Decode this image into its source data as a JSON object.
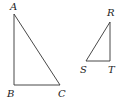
{
  "diagram": {
    "triangles": [
      {
        "name": "ABC",
        "right_angle_at": "B",
        "vertices": [
          {
            "label": "A",
            "x": 14,
            "y": 14,
            "lx": 13,
            "ly": 9
          },
          {
            "label": "B",
            "x": 14,
            "y": 85,
            "lx": 11,
            "ly": 97
          },
          {
            "label": "C",
            "x": 60,
            "y": 85,
            "lx": 62,
            "ly": 97
          }
        ]
      },
      {
        "name": "RST",
        "right_angle_at": "T",
        "vertices": [
          {
            "label": "R",
            "x": 110,
            "y": 22,
            "lx": 111,
            "ly": 15
          },
          {
            "label": "S",
            "x": 86,
            "y": 61,
            "lx": 83,
            "ly": 73
          },
          {
            "label": "T",
            "x": 110,
            "y": 61,
            "lx": 111,
            "ly": 73
          }
        ]
      }
    ]
  }
}
